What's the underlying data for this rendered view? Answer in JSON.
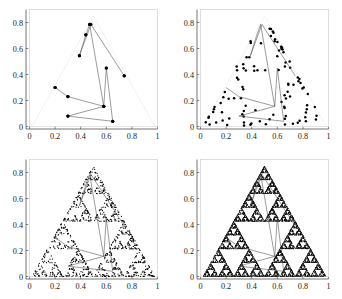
{
  "figure": {
    "title": "",
    "panel_count": 4,
    "layout": "2x2",
    "background_color": "#ffffff",
    "point_color": "#000000",
    "line_color": "#4a4a4a",
    "frame_color": "#c9c9c9"
  },
  "axes": {
    "x_ticks": [
      "0",
      "0.2",
      "0.4",
      "0.6",
      "0.8",
      "1"
    ],
    "x_tick_values": [
      0,
      0.2,
      0.4,
      0.6,
      0.8,
      1
    ],
    "y_ticks": [
      "0",
      "0.2",
      "0.4",
      "0.6",
      "0.8"
    ],
    "y_tick_values": [
      0,
      0.2,
      0.4,
      0.6,
      0.8
    ],
    "xlim": [
      0,
      1
    ],
    "ylim": [
      0,
      0.9
    ],
    "xlabel": "",
    "ylabel": ""
  },
  "chart_data": [
    {
      "type": "scatter",
      "panel": 1,
      "title": "",
      "xlabel": "",
      "ylabel": "",
      "xlim": [
        0,
        1
      ],
      "ylim": [
        0,
        0.9
      ],
      "grid": false,
      "legend": "none",
      "x_ticks": [
        0,
        0.2,
        0.4,
        0.6,
        0.8,
        1
      ],
      "y_ticks": [
        0,
        0.2,
        0.4,
        0.6,
        0.8
      ],
      "annotation": "chaos game, first 12 iterates with connecting path",
      "path_x": [
        0.2,
        0.3,
        0.58,
        0.3,
        0.65,
        0.6,
        0.58,
        0.47,
        0.44,
        0.39,
        0.48,
        0.74
      ],
      "path_y": [
        0.3,
        0.23,
        0.155,
        0.08,
        0.04,
        0.45,
        0.155,
        0.785,
        0.705,
        0.545,
        0.785,
        0.39
      ],
      "points": [
        [
          0.2,
          0.3
        ],
        [
          0.3,
          0.23
        ],
        [
          0.3,
          0.08
        ],
        [
          0.65,
          0.04
        ],
        [
          0.58,
          0.155
        ],
        [
          0.6,
          0.45
        ],
        [
          0.39,
          0.545
        ],
        [
          0.44,
          0.705
        ],
        [
          0.47,
          0.785
        ],
        [
          0.74,
          0.39
        ]
      ]
    },
    {
      "type": "scatter",
      "panel": 2,
      "title": "",
      "xlabel": "",
      "ylabel": "",
      "xlim": [
        0,
        1
      ],
      "ylim": [
        0,
        0.9
      ],
      "grid": false,
      "legend": "none",
      "x_ticks": [
        0,
        0.2,
        0.4,
        0.6,
        0.8,
        1
      ],
      "y_ticks": [
        0,
        0.2,
        0.4,
        0.6,
        0.8
      ],
      "annotation": "chaos game, about 100 iterates",
      "point_count": 100
    },
    {
      "type": "scatter",
      "panel": 3,
      "title": "",
      "xlabel": "",
      "ylabel": "",
      "xlim": [
        0,
        1
      ],
      "ylim": [
        0,
        0.9
      ],
      "grid": false,
      "legend": "none",
      "x_ticks": [
        0,
        0.2,
        0.4,
        0.6,
        0.8,
        1
      ],
      "y_ticks": [
        0,
        0.2,
        0.4,
        0.6,
        0.8
      ],
      "annotation": "chaos game, about 1000 iterates, Sierpinski outline emerging",
      "point_count": 1000
    },
    {
      "type": "scatter",
      "panel": 4,
      "title": "",
      "xlabel": "",
      "ylabel": "",
      "xlim": [
        0,
        1
      ],
      "ylim": [
        0,
        0.9
      ],
      "grid": false,
      "legend": "none",
      "x_ticks": [
        0,
        0.2,
        0.4,
        0.6,
        0.8,
        1
      ],
      "y_ticks": [
        0,
        0.2,
        0.4,
        0.6,
        0.8
      ],
      "annotation": "chaos game, about 10000 iterates, full Sierpinski gasket",
      "point_count": 10000
    }
  ],
  "triangle_vertices": [
    [
      0.02,
      0.0
    ],
    [
      0.98,
      0.0
    ],
    [
      0.5,
      0.85
    ]
  ]
}
